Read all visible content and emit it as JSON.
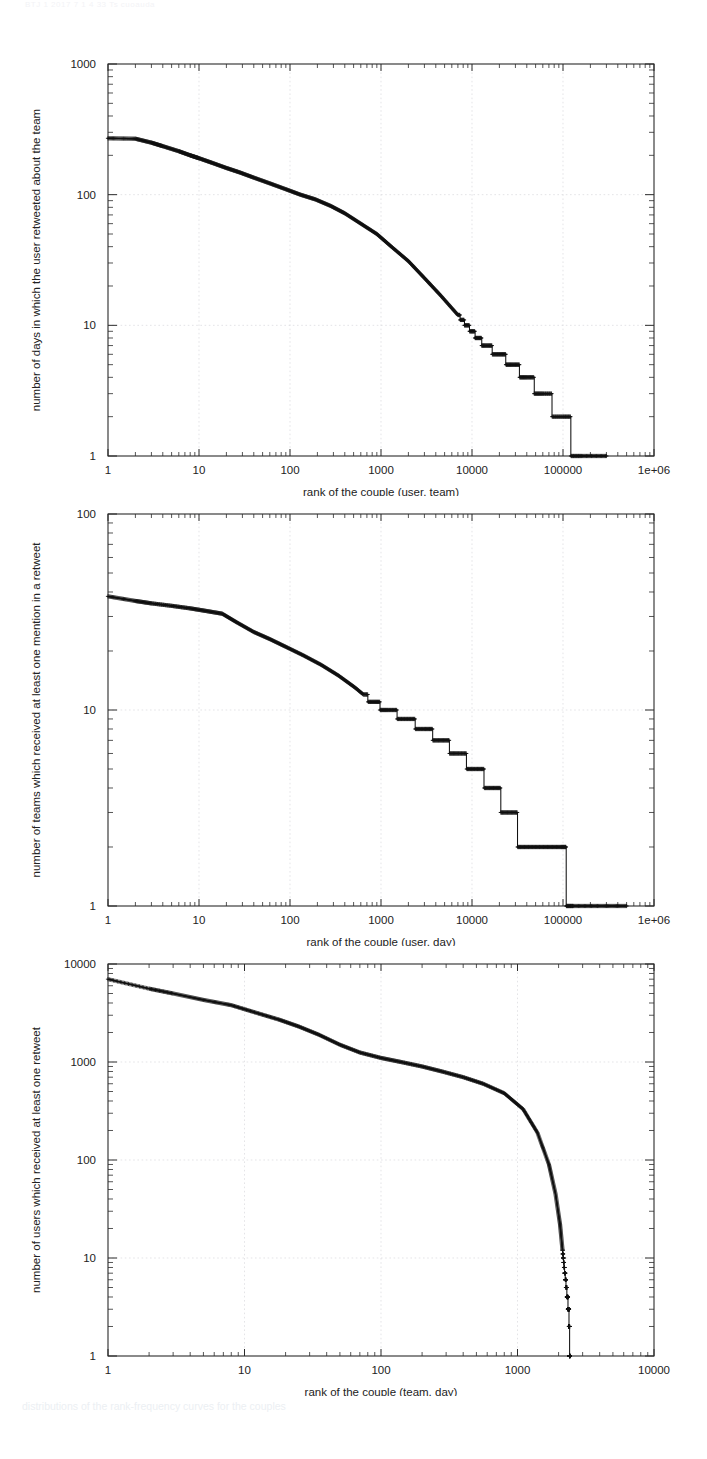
{
  "document": {
    "header_faint_text": "BTJ 1 2017 7 1 4 33 Ts cuoauda",
    "caption_faint_text": "distributions of the rank-frequency curves for the couples"
  },
  "figures": [
    {
      "id": "fig-rank-user-team",
      "chart_data": {
        "type": "line",
        "title": "",
        "subtitle": "",
        "xlabel": "rank of the couple (user, team)",
        "ylabel": "number of days in which the user retweeted about the team",
        "xscale": "log",
        "yscale": "log",
        "xlim": [
          1,
          1000000
        ],
        "ylim": [
          1,
          1000
        ],
        "xticks": [
          1,
          10,
          100,
          1000,
          10000,
          100000,
          1000000
        ],
        "xticklabels": [
          "1",
          "10",
          "100",
          "1000",
          "10000",
          "100000",
          "1e+06"
        ],
        "yticks": [
          1,
          10,
          100,
          1000
        ],
        "yticklabels": [
          "1",
          "10",
          "100",
          "1000"
        ],
        "grid": true,
        "legend": "none",
        "marker": "plus",
        "series": [
          {
            "name": "rank-frequency (user, team)",
            "x": [
              1,
              2,
              3,
              4,
              6,
              8,
              10,
              14,
              20,
              28,
              40,
              60,
              90,
              130,
              190,
              280,
              400,
              600,
              900,
              1300,
              2000,
              3000,
              4500,
              7000,
              10000,
              14000,
              20000,
              28000,
              40000,
              60000,
              100000,
              160000,
              300000
            ],
            "y": [
              270,
              268,
              250,
              235,
              215,
              200,
              190,
              175,
              160,
              148,
              135,
              122,
              110,
              100,
              92,
              82,
              72,
              60,
              50,
              40,
              31,
              23,
              17,
              12,
              9,
              7,
              6,
              5,
              4,
              3,
              2,
              1,
              1
            ]
          }
        ]
      }
    },
    {
      "id": "fig-rank-user-day",
      "chart_data": {
        "type": "line",
        "title": "",
        "subtitle": "",
        "xlabel": "rank of the couple (user, day)",
        "ylabel": "number of teams which received at least one mention in a retweet",
        "xscale": "log",
        "yscale": "log",
        "xlim": [
          1,
          1000000
        ],
        "ylim": [
          1,
          100
        ],
        "xticks": [
          1,
          10,
          100,
          1000,
          10000,
          100000,
          1000000
        ],
        "xticklabels": [
          "1",
          "10",
          "100",
          "1000",
          "10000",
          "100000",
          "1e+06"
        ],
        "yticks": [
          1,
          10,
          100
        ],
        "yticklabels": [
          "1",
          "10",
          "100"
        ],
        "grid": true,
        "legend": "none",
        "marker": "plus",
        "series": [
          {
            "name": "rank-frequency (user, day)",
            "x": [
              1,
              2,
              3,
              5,
              8,
              12,
              18,
              26,
              40,
              60,
              90,
              140,
              220,
              340,
              520,
              800,
              1200,
              1900,
              3000,
              4600,
              7000,
              11000,
              17000,
              26000,
              40000,
              62000,
              95000,
              130000,
              250000,
              500000
            ],
            "y": [
              38,
              36,
              35,
              34,
              33,
              32,
              31,
              28,
              25,
              23,
              21,
              19,
              17,
              15,
              13,
              11,
              10,
              9,
              8,
              7,
              6,
              5,
              4,
              3,
              2,
              2,
              2,
              1,
              1,
              1
            ]
          }
        ]
      }
    },
    {
      "id": "fig-rank-team-day",
      "chart_data": {
        "type": "line",
        "title": "",
        "subtitle": "",
        "xlabel": "rank of the couple (team, day)",
        "ylabel": "number of users which received at least one retweet",
        "xscale": "log",
        "yscale": "log",
        "xlim": [
          1,
          10000
        ],
        "ylim": [
          1,
          10000
        ],
        "xticks": [
          1,
          10,
          100,
          1000,
          10000
        ],
        "xticklabels": [
          "1",
          "10",
          "100",
          "1000",
          "10000"
        ],
        "yticks": [
          1,
          10,
          100,
          1000,
          10000
        ],
        "yticklabels": [
          "1",
          "10",
          "100",
          "1000",
          "10000"
        ],
        "grid": true,
        "legend": "none",
        "marker": "plus",
        "series": [
          {
            "name": "rank-frequency (team, day)",
            "x": [
              1,
              2,
              3,
              5,
              8,
              12,
              18,
              25,
              35,
              50,
              70,
              100,
              140,
              200,
              280,
              400,
              560,
              800,
              1100,
              1400,
              1700,
              1900,
              2050,
              2150,
              2250,
              2320,
              2370,
              2400,
              2420
            ],
            "y": [
              7000,
              5600,
              5000,
              4300,
              3800,
              3200,
              2700,
              2300,
              1900,
              1500,
              1250,
              1100,
              1000,
              900,
              800,
              700,
              600,
              480,
              330,
              190,
              90,
              45,
              22,
              11,
              6,
              4,
              3,
              2,
              1
            ]
          }
        ]
      }
    }
  ]
}
